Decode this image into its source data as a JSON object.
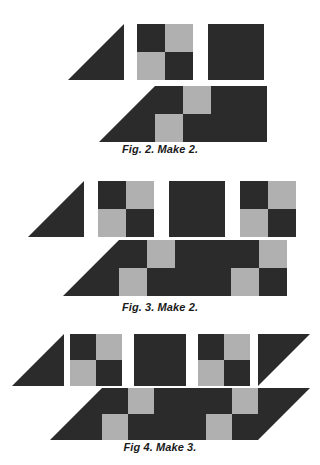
{
  "palette": {
    "dark": "#2b2b2b",
    "light": "#b0b0b0",
    "background": "#ffffff"
  },
  "figures": [
    {
      "id": "fig-2",
      "caption": "Fig. 2. Make 2.",
      "pieces": [
        {
          "name": "triangle",
          "type": "triangle",
          "orientation": "left-lean"
        },
        {
          "name": "four-patch",
          "type": "fourpatch",
          "cells": [
            "dark",
            "light",
            "light",
            "dark"
          ]
        },
        {
          "name": "plain-square",
          "type": "square",
          "color": "dark"
        }
      ],
      "assembly": [
        {
          "name": "triangle",
          "type": "triangle",
          "orientation": "left-lean"
        },
        {
          "name": "four-patch",
          "type": "fourpatch",
          "cells": [
            "dark",
            "light",
            "light",
            "dark"
          ]
        },
        {
          "name": "plain-square",
          "type": "square",
          "color": "dark"
        }
      ]
    },
    {
      "id": "fig-3",
      "caption": "Fig. 3. Make 2.",
      "pieces": [
        {
          "name": "triangle",
          "type": "triangle",
          "orientation": "left-lean"
        },
        {
          "name": "four-patch",
          "type": "fourpatch",
          "cells": [
            "dark",
            "light",
            "light",
            "dark"
          ]
        },
        {
          "name": "plain-square",
          "type": "square",
          "color": "dark"
        },
        {
          "name": "four-patch",
          "type": "fourpatch",
          "cells": [
            "dark",
            "light",
            "light",
            "dark"
          ]
        }
      ],
      "assembly": [
        {
          "name": "triangle",
          "type": "triangle",
          "orientation": "left-lean"
        },
        {
          "name": "four-patch",
          "type": "fourpatch",
          "cells": [
            "dark",
            "light",
            "light",
            "dark"
          ]
        },
        {
          "name": "plain-square",
          "type": "square",
          "color": "dark"
        },
        {
          "name": "four-patch",
          "type": "fourpatch",
          "cells": [
            "dark",
            "light",
            "light",
            "dark"
          ]
        }
      ]
    },
    {
      "id": "fig-4",
      "caption": "Fig 4. Make 3.",
      "pieces": [
        {
          "name": "triangle",
          "type": "triangle",
          "orientation": "left-lean"
        },
        {
          "name": "four-patch",
          "type": "fourpatch",
          "cells": [
            "dark",
            "light",
            "light",
            "dark"
          ]
        },
        {
          "name": "plain-square",
          "type": "square",
          "color": "dark"
        },
        {
          "name": "four-patch",
          "type": "fourpatch",
          "cells": [
            "dark",
            "light",
            "light",
            "dark"
          ]
        },
        {
          "name": "triangle-mirrored",
          "type": "triangle",
          "orientation": "right-lean"
        }
      ],
      "assembly": [
        {
          "name": "triangle",
          "type": "triangle",
          "orientation": "left-lean"
        },
        {
          "name": "four-patch",
          "type": "fourpatch",
          "cells": [
            "dark",
            "light",
            "light",
            "dark"
          ]
        },
        {
          "name": "plain-square",
          "type": "square",
          "color": "dark"
        },
        {
          "name": "four-patch",
          "type": "fourpatch",
          "cells": [
            "dark",
            "light",
            "light",
            "dark"
          ]
        },
        {
          "name": "triangle-mirrored",
          "type": "triangle",
          "orientation": "right-lean"
        }
      ]
    }
  ],
  "layout": {
    "fig2": {
      "top": 0,
      "pieces_y": 24,
      "pieces_x": [
        68,
        137,
        208
      ],
      "assembly_y": 86,
      "assembly_x": 99,
      "caption_y": 143
    },
    "fig3": {
      "top": 0,
      "pieces_y": 181,
      "pieces_x": [
        28,
        98,
        169,
        240
      ],
      "assembly_y": 240,
      "assembly_x": 63,
      "caption_y": 301
    },
    "fig4": {
      "top": 0,
      "pieces_y": 334,
      "pieces_x": [
        12,
        70,
        134,
        198,
        258
      ],
      "assembly_y": 388,
      "assembly_x": 50,
      "caption_y": 441
    }
  }
}
